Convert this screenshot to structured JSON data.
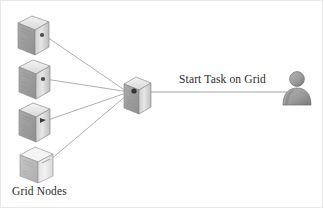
{
  "diagram": {
    "type": "grid-computing-topology",
    "background_color": "#ffffff",
    "border_color": "#e8e8e8",
    "labels": {
      "task_flow": "Start Task on Grid",
      "nodes_group": "Grid Nodes"
    },
    "colors": {
      "line": "#9a9a9a",
      "box_light": "#f0f0f0",
      "box_mid": "#d2d2d2",
      "box_dark": "#a8a8a8",
      "box_top": "#e4e4e4",
      "box_outline": "#8d8d8d",
      "person": "#9b9b9b",
      "person_dark": "#7e7e7e",
      "text": "#2b2b2b"
    },
    "nodes": [
      {
        "id": "grid-node-1",
        "name": "grid-node-server-1",
        "x": 18,
        "y": 16,
        "w": 30,
        "h": 34,
        "shade": "dark"
      },
      {
        "id": "grid-node-2",
        "name": "grid-node-server-2",
        "x": 19,
        "y": 60,
        "w": 30,
        "h": 34,
        "shade": "dark"
      },
      {
        "id": "grid-node-3",
        "name": "grid-node-server-3",
        "x": 19,
        "y": 103,
        "w": 30,
        "h": 34,
        "shade": "dark"
      },
      {
        "id": "grid-node-4",
        "name": "grid-node-server-4",
        "x": 20,
        "y": 147,
        "w": 33,
        "h": 36,
        "shade": "light"
      },
      {
        "id": "hub-node",
        "name": "grid-hub-server",
        "x": 124,
        "y": 77,
        "w": 27,
        "h": 31,
        "shade": "dark"
      }
    ],
    "links": [
      {
        "name": "link-node1-to-hub",
        "from": "grid-node-1",
        "to": "hub-node",
        "x1": 44,
        "y1": 35,
        "x2": 126,
        "y2": 92
      },
      {
        "name": "link-node2-to-hub",
        "from": "grid-node-2",
        "to": "hub-node",
        "x1": 45,
        "y1": 79,
        "x2": 126,
        "y2": 92
      },
      {
        "name": "link-node3-to-hub",
        "from": "grid-node-3",
        "to": "hub-node",
        "x1": 45,
        "y1": 121,
        "x2": 126,
        "y2": 93
      },
      {
        "name": "link-node4-to-hub",
        "from": "grid-node-4",
        "to": "hub-node",
        "x1": 50,
        "y1": 161,
        "x2": 127,
        "y2": 95
      },
      {
        "name": "link-hub-to-user",
        "from": "hub-node",
        "to": "user-actor",
        "x1": 148,
        "y1": 92,
        "x2": 286,
        "y2": 92
      }
    ],
    "actor": {
      "id": "user-actor",
      "name": "user-person-icon",
      "head_cx": 296,
      "head_cy": 79,
      "head_r": 7,
      "body_cx": 296,
      "body_cy": 100
    }
  }
}
